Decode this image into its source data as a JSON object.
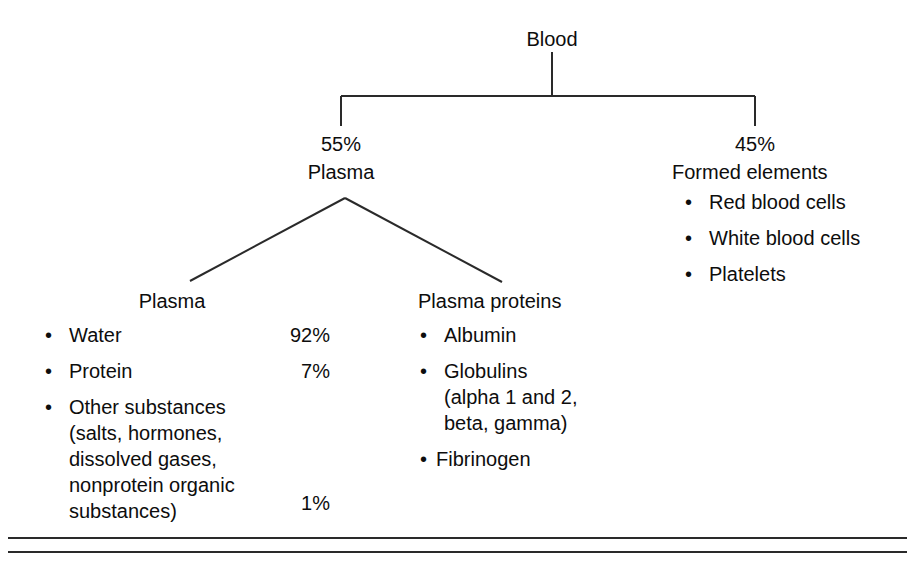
{
  "diagram": {
    "title": "Blood",
    "root": {
      "label": "Blood"
    },
    "branches": [
      {
        "percent": "55%",
        "label": "Plasma"
      },
      {
        "percent": "45%",
        "label": "Formed elements",
        "items": [
          "Red blood cells",
          "White blood cells",
          "Platelets"
        ]
      }
    ],
    "subgroups": [
      {
        "heading": "Plasma",
        "rows": [
          {
            "label": "Water",
            "value": "92%"
          },
          {
            "label": "Protein",
            "value": "7%"
          },
          {
            "label": "Other substances",
            "continuation": [
              "(salts, hormones,",
              "dissolved gases,",
              "nonprotein organic",
              "substances)"
            ],
            "value": "1%"
          }
        ]
      },
      {
        "heading": "Plasma proteins",
        "rows": [
          {
            "label": "Albumin"
          },
          {
            "label": "Globulins",
            "continuation": [
              "(alpha 1 and 2,",
              "beta, gamma)"
            ]
          },
          {
            "label": "Fibrinogen"
          }
        ]
      }
    ],
    "bullet_glyph": "•",
    "line_color": "#2a2a2a",
    "text_color": "#0d0d0d",
    "background_color": "#ffffff"
  }
}
